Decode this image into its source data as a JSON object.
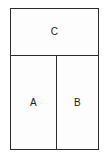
{
  "diagram": {
    "type": "partitioned-rectangle",
    "title": "",
    "background_color": "#ffffff",
    "fill_color": "#fdfdfd",
    "stroke_color": "#2b2b2b",
    "label_color": "#1a1a1a",
    "outer_frame": {
      "name": "outer-rectangle",
      "x": 10,
      "y": 8,
      "width": 89,
      "height": 142
    },
    "dividers": [
      {
        "name": "horizontal-divider",
        "orientation": "horizontal",
        "position": 55
      },
      {
        "name": "vertical-divider",
        "orientation": "vertical",
        "position": 56
      }
    ],
    "regions": [
      {
        "id": "c",
        "label": "C",
        "x": 11,
        "y": 9,
        "width": 87,
        "height": 46,
        "position": "top-full-width"
      },
      {
        "id": "a",
        "label": "A",
        "x": 11,
        "y": 56,
        "width": 45,
        "height": 93,
        "position": "bottom-left"
      },
      {
        "id": "b",
        "label": "B",
        "x": 57,
        "y": 56,
        "width": 41,
        "height": 93,
        "position": "bottom-right"
      }
    ]
  }
}
